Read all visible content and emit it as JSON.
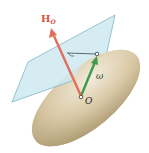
{
  "diagram": {
    "labels": {
      "angular_momentum_main": "H",
      "angular_momentum_sub": "O",
      "angular_velocity": "ω",
      "origin": "O"
    },
    "colors": {
      "background": "#ffffff",
      "plane_fill": "#cfe9f1",
      "plane_stroke": "#7fb6c8",
      "body_light": "#efe6d2",
      "body_mid": "#d6c6a2",
      "body_dark": "#a8956c",
      "h_vector": "#e0705a",
      "omega_vector": "#3f9a4c",
      "h_label": "#d9533b",
      "text_dark": "#222222"
    }
  }
}
